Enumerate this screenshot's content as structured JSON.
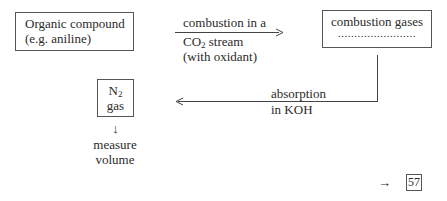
{
  "nodes": {
    "organic_compound": {
      "line1": "Organic compound",
      "line2": "(e.g. aniline)"
    },
    "combustion_gases": {
      "line1": "combustion gases",
      "line2": "........................"
    },
    "n2_gas": {
      "formula_base": "N",
      "formula_sub": "2",
      "line2": "gas"
    }
  },
  "edges": {
    "combustion": {
      "line1": "combustion in a",
      "line2_base": "CO",
      "line2_sub": "2",
      "line2_rest": " stream",
      "line3": "(with oxidant)"
    },
    "absorption": {
      "line1": "absorption",
      "line2": "in KOH"
    },
    "measure": {
      "arrow": "↓",
      "line1": "measure",
      "line2": "volume"
    }
  },
  "footer": {
    "arrow": "→",
    "page_ref": "57"
  }
}
